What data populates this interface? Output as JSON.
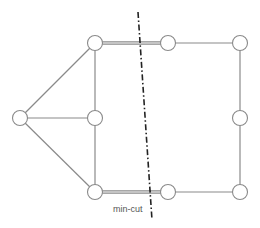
{
  "diagram": {
    "type": "graph",
    "annotation": {
      "label": "min-cut",
      "x": 113,
      "y": 212
    },
    "colors": {
      "edge": "#8a8a8a",
      "node_fill": "#ffffff",
      "cut_line": "#222222",
      "label": "#555555"
    },
    "nodes": [
      {
        "id": "top-left-hub",
        "x": 95,
        "y": 43
      },
      {
        "id": "left",
        "x": 20,
        "y": 118
      },
      {
        "id": "middle",
        "x": 95,
        "y": 118
      },
      {
        "id": "bottom-left-hub",
        "x": 95,
        "y": 192
      },
      {
        "id": "top-mid-right",
        "x": 168,
        "y": 43
      },
      {
        "id": "top-right",
        "x": 240,
        "y": 43
      },
      {
        "id": "right-middle",
        "x": 240,
        "y": 118
      },
      {
        "id": "bottom-mid-right",
        "x": 168,
        "y": 192
      },
      {
        "id": "bottom-right",
        "x": 240,
        "y": 192
      }
    ],
    "edges": [
      {
        "from": "top-left-hub",
        "to": "left",
        "double": false
      },
      {
        "from": "top-left-hub",
        "to": "middle",
        "double": false
      },
      {
        "from": "left",
        "to": "middle",
        "double": false
      },
      {
        "from": "left",
        "to": "bottom-left-hub",
        "double": false
      },
      {
        "from": "middle",
        "to": "bottom-left-hub",
        "double": false
      },
      {
        "from": "top-left-hub",
        "to": "top-mid-right",
        "double": true
      },
      {
        "from": "bottom-left-hub",
        "to": "bottom-mid-right",
        "double": true
      },
      {
        "from": "top-mid-right",
        "to": "top-right",
        "double": false
      },
      {
        "from": "top-right",
        "to": "right-middle",
        "double": false
      },
      {
        "from": "right-middle",
        "to": "bottom-right",
        "double": false
      },
      {
        "from": "bottom-mid-right",
        "to": "bottom-right",
        "double": false
      }
    ],
    "cut_line": {
      "x1": 138,
      "y1": 12,
      "x2": 152,
      "y2": 220,
      "style": "dash-dot"
    }
  }
}
